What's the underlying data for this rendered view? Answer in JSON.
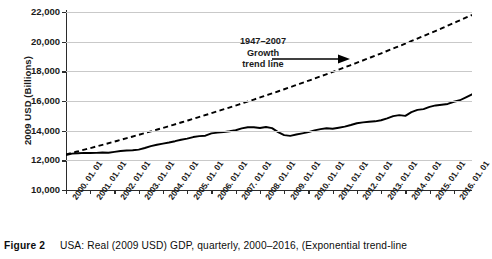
{
  "figure": {
    "label": "Figure 2",
    "caption": "USA: Real (2009 USD) GDP, quarterly, 2000–2016, (Exponential trend-line"
  },
  "annotation": {
    "line1": "1947–2007",
    "line2": "Growth",
    "line3": "trend line",
    "arrow_icon": "right-arrow-icon"
  },
  "chart_data": {
    "type": "line",
    "title": "",
    "xlabel": "",
    "ylabel": "2009 USD (Billions)",
    "ylim": [
      10000,
      22000
    ],
    "yticks": [
      10000,
      12000,
      14000,
      16000,
      18000,
      20000,
      22000
    ],
    "ytick_labels": [
      "10,000",
      "12,000",
      "14,000",
      "16,000",
      "18,000",
      "20,000",
      "22,000"
    ],
    "grid": true,
    "legend": "none",
    "xtick_labels": [
      "2000. 01. 01",
      "2001. 01. 01",
      "2002. 01. 01",
      "2003. 01. 01",
      "2004. 01. 01",
      "2005. 01. 01",
      "2006. 01. 01",
      "2007. 01. 01",
      "2008. 01. 01",
      "2009. 01. 01",
      "2010. 01. 01",
      "2011. 01. 01",
      "2012. 01. 01",
      "2013. 01. 01",
      "2014. 01. 01",
      "2015. 01. 01",
      "2016. 01. 01"
    ],
    "xlim": [
      2000.0,
      2016.75
    ],
    "series": [
      {
        "name": "Real GDP (quarterly)",
        "style": "solid",
        "color": "#000000",
        "x": [
          2000.0,
          2000.25,
          2000.5,
          2000.75,
          2001.0,
          2001.25,
          2001.5,
          2001.75,
          2002.0,
          2002.25,
          2002.5,
          2002.75,
          2003.0,
          2003.25,
          2003.5,
          2003.75,
          2004.0,
          2004.25,
          2004.5,
          2004.75,
          2005.0,
          2005.25,
          2005.5,
          2005.75,
          2006.0,
          2006.25,
          2006.5,
          2006.75,
          2007.0,
          2007.25,
          2007.5,
          2007.75,
          2008.0,
          2008.25,
          2008.5,
          2008.75,
          2009.0,
          2009.25,
          2009.5,
          2009.75,
          2010.0,
          2010.25,
          2010.5,
          2010.75,
          2011.0,
          2011.25,
          2011.5,
          2011.75,
          2012.0,
          2012.25,
          2012.5,
          2012.75,
          2013.0,
          2013.25,
          2013.5,
          2013.75,
          2014.0,
          2014.25,
          2014.5,
          2014.75,
          2015.0,
          2015.25,
          2015.5,
          2015.75,
          2016.0,
          2016.25,
          2016.5,
          2016.75
        ],
        "values": [
          12360,
          12450,
          12480,
          12500,
          12490,
          12500,
          12530,
          12510,
          12570,
          12630,
          12660,
          12680,
          12720,
          12830,
          12960,
          13050,
          13130,
          13200,
          13290,
          13390,
          13460,
          13570,
          13630,
          13660,
          13820,
          13870,
          13900,
          13960,
          14030,
          14150,
          14230,
          14230,
          14180,
          14250,
          14170,
          13900,
          13700,
          13650,
          13740,
          13820,
          13900,
          14020,
          14100,
          14160,
          14130,
          14200,
          14270,
          14380,
          14500,
          14560,
          14600,
          14630,
          14700,
          14830,
          14980,
          15050,
          15000,
          15250,
          15400,
          15450,
          15600,
          15700,
          15750,
          15800,
          15950,
          16050,
          16250,
          16450
        ]
      },
      {
        "name": "1947–2007 Growth trend line",
        "style": "dashed",
        "color": "#000000",
        "x": [
          2000.0,
          2016.75
        ],
        "values": [
          12400,
          21800
        ],
        "note": "exponential trend fitted to 1947–2007 growth"
      }
    ]
  }
}
